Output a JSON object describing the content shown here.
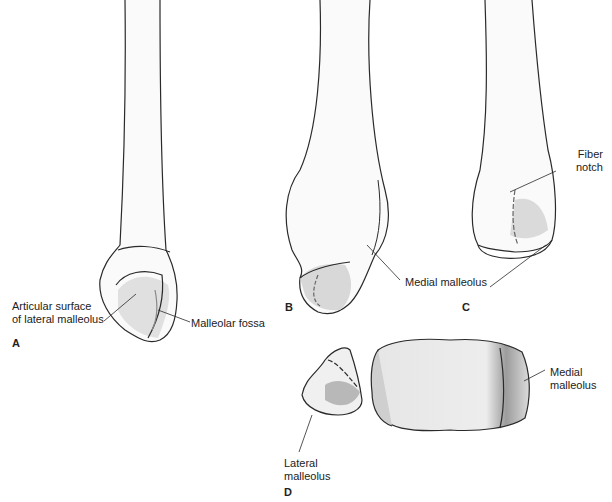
{
  "figure": {
    "panels": [
      {
        "id": "A",
        "letter": "A",
        "labels": [
          "Articular surface\nof lateral malleolus",
          "Malleolar fossa"
        ]
      },
      {
        "id": "B",
        "letter": "B",
        "labels": [
          "Medial malleolus"
        ]
      },
      {
        "id": "C",
        "letter": "C",
        "labels": [
          "Fiber\nnotch"
        ]
      },
      {
        "id": "D",
        "letter": "D",
        "labels": [
          "Lateral\nmalleolus",
          "Medial\nmalleolus"
        ]
      }
    ],
    "colors": {
      "outline": "#2a2a2a",
      "shade": "#c8c8c8",
      "dark_shade": "#9a9a9a",
      "background": "#ffffff"
    }
  },
  "labels": {
    "a_articular": "Articular surface\nof lateral malleolus",
    "a_fossa": "Malleolar fossa",
    "b_medial": "Medial malleolus",
    "c_fiber": "Fiber\nnotch",
    "d_lateral": "Lateral\nmalleolus",
    "d_medial": "Medial\nmalleolus"
  },
  "panel_letters": {
    "a": "A",
    "b": "B",
    "c": "C",
    "d": "D"
  }
}
